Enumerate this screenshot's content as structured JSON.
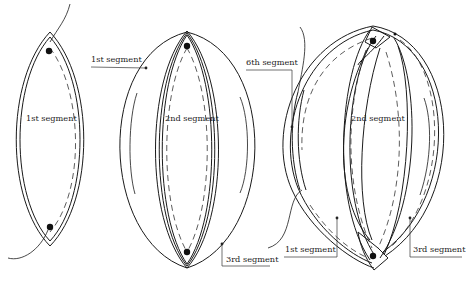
{
  "diagram": {
    "title": "",
    "stroke_color": "#1a1a1a",
    "background": "#ffffff",
    "panels": [
      {
        "id": "panel-1",
        "labels": [
          {
            "text": "1st segment",
            "role": "center-label"
          }
        ]
      },
      {
        "id": "panel-2",
        "labels": [
          {
            "text": "1st segment",
            "role": "callout-left"
          },
          {
            "text": "2nd segment",
            "role": "center-label"
          },
          {
            "text": "3rd segment",
            "role": "callout-bottom-right"
          }
        ]
      },
      {
        "id": "panel-3",
        "labels": [
          {
            "text": "6th segment",
            "role": "callout-left"
          },
          {
            "text": "2nd segment",
            "role": "center-label"
          },
          {
            "text": "1st segment",
            "role": "callout-bottom-left"
          },
          {
            "text": "3rd segment",
            "role": "callout-bottom-right"
          }
        ]
      }
    ]
  }
}
